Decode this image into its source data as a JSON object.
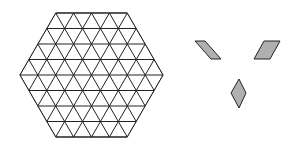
{
  "diagram": {
    "hexagon_grid": {
      "shape": "regular-hexagon",
      "side_units": 4,
      "tiling": "equilateral-triangles",
      "triangle_count": 96,
      "stroke": "#222222",
      "fill": "#ffffff"
    },
    "pieces": [
      {
        "name": "rhombus-left",
        "fill": "#b0b0b0",
        "stroke": "#222222"
      },
      {
        "name": "rhombus-right",
        "fill": "#b0b0b0",
        "stroke": "#222222"
      },
      {
        "name": "rhombus-bottom",
        "fill": "#b0b0b0",
        "stroke": "#222222"
      }
    ]
  }
}
